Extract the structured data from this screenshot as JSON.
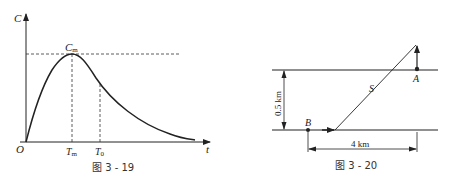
{
  "figure_left": {
    "caption": "图 3 - 19",
    "y_axis_label": "C",
    "x_axis_label": "t",
    "origin_label": "O",
    "peak_label": "C",
    "peak_label_sub": "m",
    "tm_label": "T",
    "tm_label_sub": "m",
    "t0_label": "T",
    "t0_label_sub": "0",
    "line_color": "#222222"
  },
  "figure_right": {
    "caption": "图 3 - 20",
    "vertical_dimension": "0.5 km",
    "horizontal_dimension": "4 km",
    "point_a_label": "A",
    "point_b_label": "B",
    "path_label": "S",
    "line_color": "#222222"
  }
}
